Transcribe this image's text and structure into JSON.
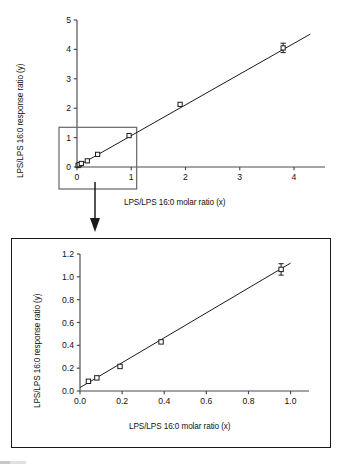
{
  "figure": {
    "background_color": "#ffffff",
    "line_color": "#1a1a1a",
    "marker_color": "#ffffff",
    "marker_edge_color": "#1a1a1a"
  },
  "top_chart": {
    "xlabel": "LPS/LPS 16:0 molar ratio (x)",
    "ylabel": "LPS/LPS 16:0 response ratio (y)",
    "x_ticks": [
      "0",
      "1",
      "2",
      "3",
      "4"
    ],
    "y_ticks": [
      "0",
      "1",
      "2",
      "3",
      "4",
      "5"
    ]
  },
  "bottom_chart": {
    "xlabel": "LPS/LPS 16:0 molar ratio (x)",
    "ylabel": "LPS/LPS 16:0 response ratio (y)",
    "x_ticks": [
      "0.0",
      "0.2",
      "0.4",
      "0.6",
      "0.8",
      "1.0"
    ],
    "y_ticks": [
      "0.0",
      "0.2",
      "0.4",
      "0.6",
      "0.8",
      "1.0",
      "1.2"
    ]
  },
  "annotations": {
    "inset_box_label": "inset-region",
    "arrow_label": "expansion-arrow"
  },
  "chart_data": [
    {
      "type": "scatter",
      "id": "top",
      "title": "",
      "xlabel": "LPS/LPS 16:0 molar ratio (x)",
      "ylabel": "LPS/LPS 16:0 response ratio (y)",
      "xlim": [
        0,
        4.35
      ],
      "ylim": [
        0,
        5
      ],
      "xticks": [
        0,
        1,
        2,
        3,
        4
      ],
      "yticks": [
        0,
        1,
        2,
        3,
        4,
        5
      ],
      "grid": false,
      "legend": null,
      "series": [
        {
          "name": "LPS response ratio",
          "marker": "open-square",
          "x": [
            0.02,
            0.04,
            0.08,
            0.19,
            0.38,
            0.96,
            1.9,
            3.8
          ],
          "y": [
            0.05,
            0.08,
            0.12,
            0.21,
            0.43,
            1.07,
            2.13,
            4.05
          ],
          "yerr": [
            0,
            0,
            0,
            0,
            0,
            0,
            0,
            0.16
          ]
        }
      ],
      "fit_line": {
        "type": "linear",
        "x": [
          0.0,
          4.3
        ],
        "y": [
          0.02,
          4.52
        ]
      },
      "annotations": [
        {
          "kind": "rectangle",
          "name": "inset-region",
          "x0": 0.0,
          "y0": 0.0,
          "x1": 1.1,
          "y1": 1.35
        }
      ]
    },
    {
      "type": "scatter",
      "id": "bottom",
      "title": "",
      "xlabel": "LPS/LPS 16:0 molar ratio (x)",
      "ylabel": "LPS/LPS 16:0 response ratio (y)",
      "xlim": [
        0,
        1.04
      ],
      "ylim": [
        0,
        1.2
      ],
      "xticks": [
        0.0,
        0.2,
        0.4,
        0.6,
        0.8,
        1.0
      ],
      "yticks": [
        0.0,
        0.2,
        0.4,
        0.6,
        0.8,
        1.0,
        1.2
      ],
      "grid": false,
      "legend": null,
      "series": [
        {
          "name": "LPS response ratio",
          "marker": "open-square",
          "x": [
            0.04,
            0.08,
            0.19,
            0.385,
            0.955
          ],
          "y": [
            0.085,
            0.115,
            0.215,
            0.43,
            1.065
          ],
          "yerr": [
            0,
            0,
            0,
            0,
            0.05
          ]
        }
      ],
      "fit_line": {
        "type": "linear",
        "x": [
          0.0,
          1.0
        ],
        "y": [
          0.03,
          1.12
        ]
      }
    }
  ]
}
